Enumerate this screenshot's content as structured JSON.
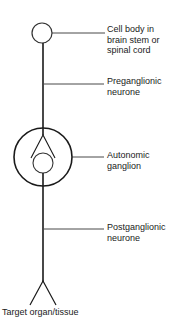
{
  "diagram": {
    "type": "autonomic-neurone-pathway",
    "labels": {
      "cell_body": "Cell body in\nbrain stem or\nspinal cord",
      "preganglionic": "Preganglionic\nneurone",
      "ganglion": "Autonomic\nganglion",
      "postganglionic": "Postganglionic\nneurone",
      "target": "Target organ/tissue"
    },
    "colors": {
      "stroke": "#1a1a1a",
      "background": "#ffffff"
    }
  }
}
